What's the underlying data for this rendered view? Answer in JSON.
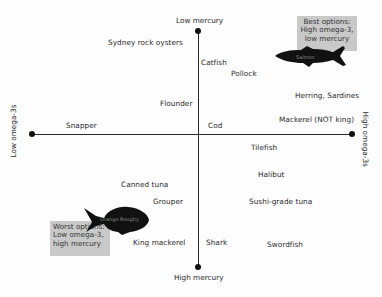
{
  "axes": {
    "top": "Low mercury",
    "bottom": "High mercury",
    "left": "Low omega-3s",
    "right": "High omega-3s"
  },
  "callouts": {
    "best": {
      "line1": "Best options:",
      "line2": "High omega-3,",
      "line3": "low mercury",
      "fish": "Salmon"
    },
    "worst": {
      "line1": "Worst options:",
      "line2": "Low omega-3,",
      "line3": "high mercury",
      "fish": "Orange Roughy"
    }
  },
  "fish": [
    {
      "name": "Sydney rock oysters"
    },
    {
      "name": "Catfish"
    },
    {
      "name": "Pollock"
    },
    {
      "name": "Flounder"
    },
    {
      "name": "Herring, Sardines"
    },
    {
      "name": "Snapper"
    },
    {
      "name": "Cod"
    },
    {
      "name": "Mackerel (NOT king)"
    },
    {
      "name": "Tilefish"
    },
    {
      "name": "Halibut"
    },
    {
      "name": "Canned tuna"
    },
    {
      "name": "Grouper"
    },
    {
      "name": "Sushi-grade tuna"
    },
    {
      "name": "King mackerel"
    },
    {
      "name": "Shark"
    },
    {
      "name": "Swordfish"
    }
  ],
  "colors": {
    "callout_bg": "#c9c9c9",
    "axis": "#2a2a2a",
    "silhouette": "#111111"
  }
}
